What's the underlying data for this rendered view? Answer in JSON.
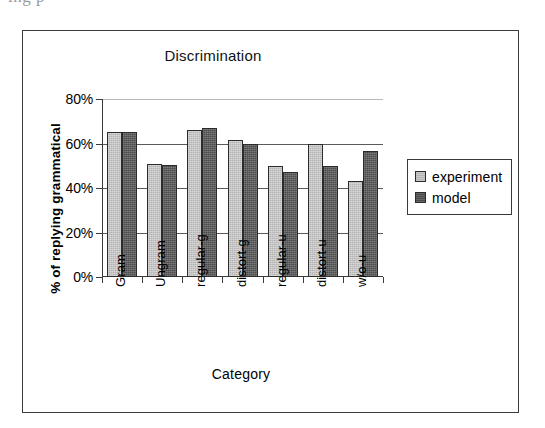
{
  "page": {
    "bleed_text_above_figure": "ing  p"
  },
  "figure": {
    "title": "Discrimination",
    "x_axis_title": "Category",
    "y_axis_title": "% of replying grammatical"
  },
  "legend": {
    "position": "right",
    "entries": [
      {
        "label": "experiment",
        "swatch": "experiment-swatch",
        "color": "#b4b4b4"
      },
      {
        "label": "model",
        "swatch": "model-swatch",
        "color": "#4a4a4a"
      }
    ]
  },
  "chart_data": {
    "type": "bar",
    "title": "Discrimination",
    "xlabel": "Category",
    "ylabel": "% of replying grammatical",
    "categories": [
      "Gram",
      "Ungram",
      "regular-g",
      "distort-g",
      "regular-u",
      "distort-u",
      "w/o-u"
    ],
    "series": [
      {
        "name": "experiment",
        "color": "#b4b4b4",
        "values": [
          65,
          51,
          66,
          61.5,
          50,
          60,
          43
        ]
      },
      {
        "name": "model",
        "color": "#4a4a4a",
        "values": [
          65,
          50.5,
          67,
          60,
          47,
          50,
          56.5
        ]
      }
    ],
    "ylim": [
      0,
      80
    ],
    "ytick_values": [
      80,
      60,
      40,
      20,
      0
    ],
    "ytick_labels": [
      "80%",
      "60%",
      "40%",
      "20%",
      "0%"
    ],
    "grid": "horizontal",
    "value_unit": "%"
  }
}
